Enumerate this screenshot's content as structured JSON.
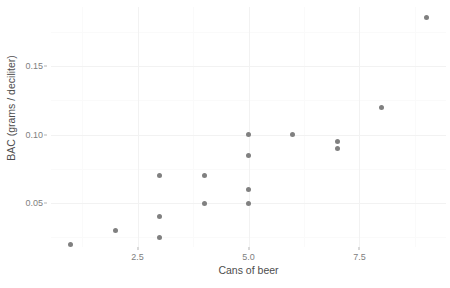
{
  "chart_data": {
    "type": "scatter",
    "title": "",
    "xlabel": "Cans of beer",
    "ylabel": "BAC (grams / deciliter)",
    "xlim": [
      0.55,
      9.45
    ],
    "ylim": [
      0.018,
      0.193
    ],
    "x_ticks": [
      2.5,
      5.0,
      7.5
    ],
    "x_tick_labels": [
      "2.5",
      "5.0",
      "7.5"
    ],
    "y_ticks": [
      0.05,
      0.1,
      0.15
    ],
    "y_tick_labels": [
      "0.05",
      "0.10",
      "0.15"
    ],
    "x_minor_ticks": [
      1.25,
      3.75,
      6.25,
      8.75
    ],
    "y_minor_ticks": [
      0.025,
      0.075,
      0.125,
      0.175
    ],
    "grid": true,
    "legend": "none",
    "point_color": "#808080",
    "points": [
      {
        "x": 1,
        "y": 0.02
      },
      {
        "x": 2,
        "y": 0.03
      },
      {
        "x": 3,
        "y": 0.07
      },
      {
        "x": 3,
        "y": 0.04
      },
      {
        "x": 3,
        "y": 0.025
      },
      {
        "x": 4,
        "y": 0.07
      },
      {
        "x": 4,
        "y": 0.05
      },
      {
        "x": 5,
        "y": 0.1
      },
      {
        "x": 5,
        "y": 0.085
      },
      {
        "x": 5,
        "y": 0.06
      },
      {
        "x": 5,
        "y": 0.05
      },
      {
        "x": 6,
        "y": 0.1
      },
      {
        "x": 7,
        "y": 0.095
      },
      {
        "x": 7,
        "y": 0.09
      },
      {
        "x": 8,
        "y": 0.12
      },
      {
        "x": 9,
        "y": 0.185
      }
    ]
  }
}
